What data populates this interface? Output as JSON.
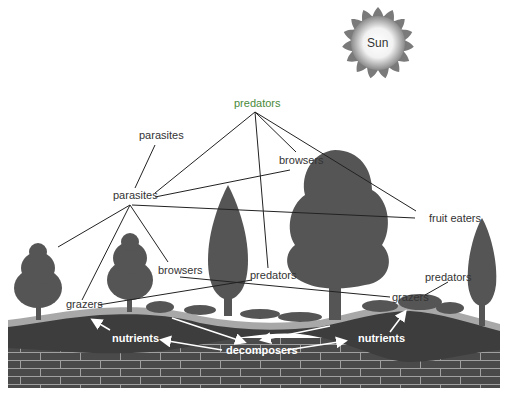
{
  "diagram": {
    "title": "",
    "sun_label": "Sun",
    "labels": {
      "predators_top": "predators",
      "parasites_upper": "parasites",
      "parasites_mid": "parasites",
      "browsers_upper": "browsers",
      "fruit_eaters": "fruit eaters",
      "browsers_lower": "browsers",
      "predators_mid": "predators",
      "predators_right": "predators",
      "grazers_left": "grazers",
      "grazers_right": "grazers",
      "nutrients_left": "nutrients",
      "nutrients_right": "nutrients",
      "decomposers": "decomposers"
    },
    "colors": {
      "tree": "#555555",
      "soil": "#3d3d3d",
      "topsoil_band": "#a8a8a8",
      "bedrock": "#4a4a4a",
      "bedrock_lines": "#9a9a9a",
      "predators_top_text": "#4a8a3a",
      "line": "#222222"
    }
  }
}
